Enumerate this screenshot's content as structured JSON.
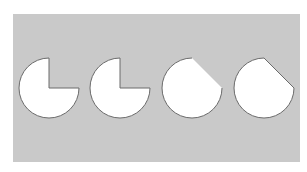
{
  "figure": {
    "title": "",
    "panel": {
      "x": 13,
      "y": 14,
      "width": 287,
      "height": 148,
      "fill": "#c9c9c9"
    },
    "style": {
      "shape_fill": "#ffffff",
      "outline_color": "#6b6b6b",
      "outline_width": 1
    },
    "shapes": [
      {
        "id": "shape-1",
        "type": "circle-with-quarter-notch",
        "cx": 49,
        "cy": 88,
        "r": 30,
        "missing_quadrant": "top-right",
        "outline_on_cut_edge": true
      },
      {
        "id": "shape-2",
        "type": "circle-with-quarter-notch",
        "cx": 120,
        "cy": 88,
        "r": 30,
        "missing_quadrant": "top-right",
        "outline_on_cut_edge": true
      },
      {
        "id": "shape-3",
        "type": "circle-with-chord-cut",
        "cx": 192,
        "cy": 88,
        "r": 30,
        "chord_from": "top",
        "chord_to": "right",
        "outline_on_cut_edge": false
      },
      {
        "id": "shape-4",
        "type": "circle-with-chord-cut",
        "cx": 264,
        "cy": 88,
        "r": 30,
        "chord_from": "top",
        "chord_to": "right",
        "outline_on_cut_edge": true
      }
    ]
  }
}
